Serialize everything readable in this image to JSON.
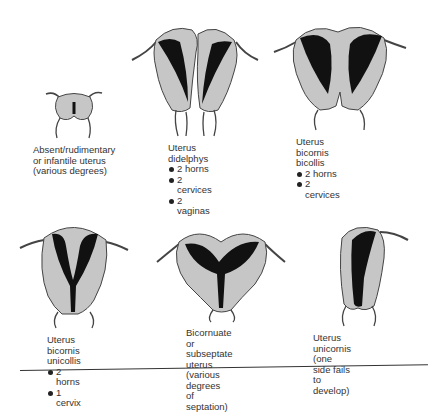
{
  "diagram": {
    "colors": {
      "tissue": "#c6c6c6",
      "cavity": "#111111",
      "outline": "#444444",
      "background": "#ffffff"
    },
    "figures": [
      {
        "id": "absent-rudimentary",
        "title_lines": [
          "Absent/rudimentary",
          "or infantile uterus",
          "(various degrees)"
        ],
        "bullets": []
      },
      {
        "id": "didelphys",
        "title_lines": [
          "Uterus didelphys"
        ],
        "bullets": [
          "2 horns",
          "2 cervices",
          "2 vaginas"
        ]
      },
      {
        "id": "bicornis-bicollis",
        "title_lines": [
          "Uterus bicornis bicollis"
        ],
        "bullets": [
          "2 horns",
          "2 cervices"
        ]
      },
      {
        "id": "bicornis-unicollis",
        "title_lines": [
          "Uterus bicornis",
          "unicollis"
        ],
        "bullets": [
          "2 horns",
          "1 cervix"
        ]
      },
      {
        "id": "bicornuate-subseptate",
        "title_lines": [
          "Bicornuate or",
          "subseptate uterus",
          "(various degrees",
          "of septation)"
        ],
        "bullets": []
      },
      {
        "id": "unicornis",
        "title_lines": [
          "Uterus unicornis",
          "(one side fails",
          "to develop)"
        ],
        "bullets": []
      }
    ]
  }
}
